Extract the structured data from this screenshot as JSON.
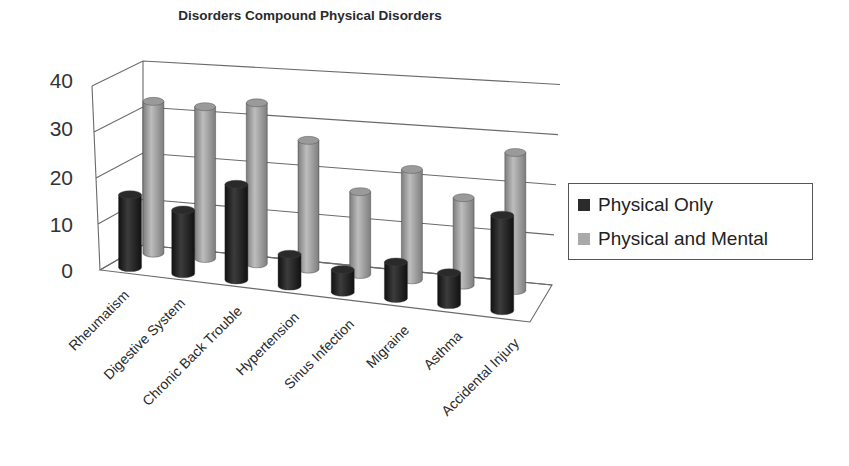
{
  "chart_data": {
    "type": "bar",
    "subtype": "3d-cylinder-clustered",
    "title": "Disorders Compound Physical Disorders",
    "xlabel": "",
    "ylabel": "",
    "ylim": [
      0,
      40
    ],
    "yticks": [
      "0",
      "10",
      "20",
      "30",
      "40"
    ],
    "grid": true,
    "legend_position": "right",
    "categories": [
      "Rheumatism",
      "Digestive System",
      "Chronic Back Trouble",
      "Hypertension",
      "Sinus Infection",
      "Migraine",
      "Asthma",
      "Accidental Injury"
    ],
    "series": [
      {
        "name": "Physical Only",
        "color": "#2b2b2b",
        "values": [
          16,
          14,
          21,
          7,
          5,
          8,
          7,
          21
        ]
      },
      {
        "name": "Physical and Mental",
        "color": "#a9a9a9",
        "values": [
          33,
          33,
          35,
          28,
          18,
          24,
          19,
          30
        ]
      }
    ]
  },
  "legend": {
    "items": [
      {
        "label": "Physical Only",
        "color": "#2b2b2b"
      },
      {
        "label": "Physical and Mental",
        "color": "#a9a9a9"
      }
    ]
  }
}
